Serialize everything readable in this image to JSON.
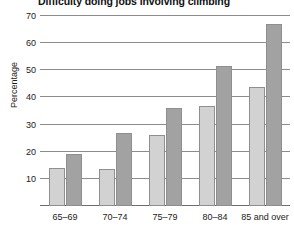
{
  "chart_data": {
    "type": "bar",
    "title": "Difficulty doing jobs involving climbing",
    "xlabel": "",
    "ylabel": "Percentage",
    "categories": [
      "65–69",
      "70–74",
      "75–79",
      "80–84",
      "85 and over"
    ],
    "series": [
      {
        "name": "series-1",
        "color": "#d2d2d2",
        "values": [
          14,
          13.5,
          26,
          37,
          44
        ]
      },
      {
        "name": "series-2",
        "color": "#a2a2a2",
        "values": [
          19,
          27,
          36,
          51.5,
          67
        ]
      }
    ],
    "ylim": [
      0,
      70
    ],
    "yticks": [
      0,
      10,
      20,
      30,
      40,
      50,
      60,
      70
    ],
    "ytick_labels": [
      "",
      "10",
      "20",
      "30",
      "40",
      "50",
      "60",
      "70"
    ],
    "grid": true,
    "legend": "none"
  },
  "colors": {
    "background": "#ffffff",
    "gridline": "#8c8c8c",
    "text": "#1a1a1a"
  }
}
